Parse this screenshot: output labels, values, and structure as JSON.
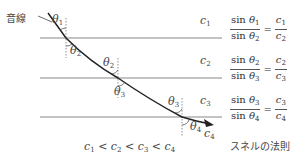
{
  "title_label": "音線",
  "media": [
    {
      "label": "c",
      "sub": "1"
    },
    {
      "label": "c",
      "sub": "2"
    },
    {
      "label": "c",
      "sub": "3"
    },
    {
      "label": "c",
      "sub": "4"
    }
  ],
  "angles": [
    {
      "label": "θ",
      "sub": "1"
    },
    {
      "label": "θ",
      "sub": "2"
    },
    {
      "label": "θ",
      "sub": "2"
    },
    {
      "label": "θ",
      "sub": "3"
    },
    {
      "label": "θ",
      "sub": "3"
    },
    {
      "label": "θ",
      "sub": "4"
    }
  ],
  "equations": [
    {
      "num_fn": "sin",
      "num_var": "θ",
      "num_sub": "1",
      "den_fn": "sin",
      "den_var": "θ",
      "den_sub": "2",
      "rnum": "c",
      "rnum_sub": "1",
      "rden": "c",
      "rden_sub": "2"
    },
    {
      "num_fn": "sin",
      "num_var": "θ",
      "num_sub": "2",
      "den_fn": "sin",
      "den_var": "θ",
      "den_sub": "3",
      "rnum": "c",
      "rnum_sub": "2",
      "rden": "c",
      "rden_sub": "3"
    },
    {
      "num_fn": "sin",
      "num_var": "θ",
      "num_sub": "3",
      "den_fn": "sin",
      "den_var": "θ",
      "den_sub": "4",
      "rnum": "c",
      "rnum_sub": "3",
      "rden": "c",
      "rden_sub": "4"
    }
  ],
  "inequality": {
    "parts": [
      "c",
      "1",
      "<",
      "c",
      "2",
      "<",
      "c",
      "3",
      "<",
      "c",
      "4"
    ]
  },
  "law_caption": "スネルの法則"
}
